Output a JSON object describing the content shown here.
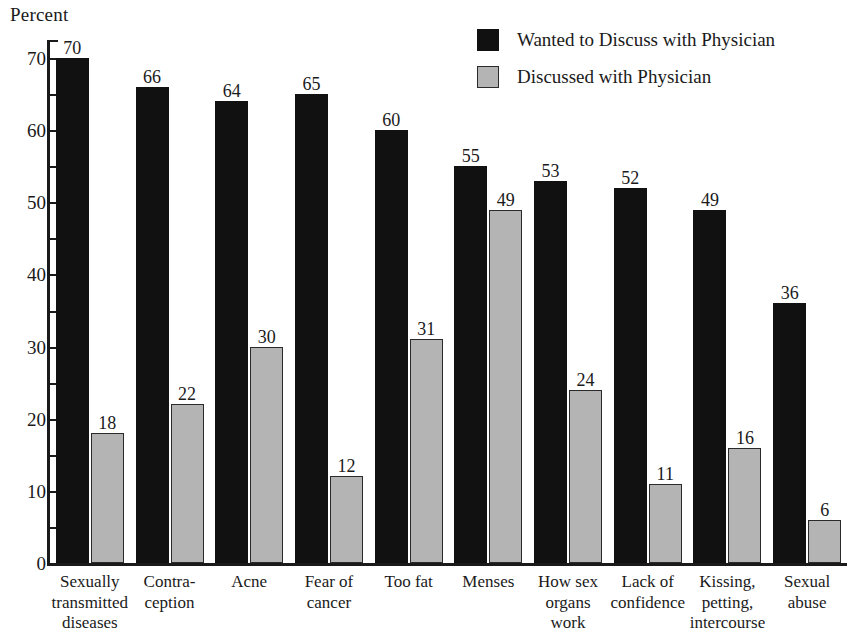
{
  "chart_data": {
    "type": "bar",
    "title": "",
    "subtitle": "",
    "xlabel": "",
    "ylabel": "Percent",
    "ylim": [
      0,
      72.5
    ],
    "yticks": [
      0,
      10,
      20,
      30,
      40,
      50,
      60,
      70
    ],
    "ytick_labels": [
      "0",
      "10",
      "20",
      "30",
      "40",
      "50",
      "60",
      "70"
    ],
    "minor_tick_step": 5,
    "grid": false,
    "legend_position": "top-right",
    "categories": [
      "Sexually transmitted diseases",
      "Contraception",
      "Acne",
      "Fear of cancer",
      "Too fat",
      "Menses",
      "How sex organs work",
      "Lack of confidence",
      "Kissing, petting, intercourse",
      "Sexual abuse"
    ],
    "category_lines": [
      [
        "Sexually",
        "transmitted",
        "diseases"
      ],
      [
        "Contra-",
        "ception"
      ],
      [
        "Acne"
      ],
      [
        "Fear of",
        "cancer"
      ],
      [
        "Too fat"
      ],
      [
        "Menses"
      ],
      [
        "How sex",
        "organs",
        "work"
      ],
      [
        "Lack of",
        "confidence"
      ],
      [
        "Kissing,",
        "petting,",
        "intercourse"
      ],
      [
        "Sexual",
        "abuse"
      ]
    ],
    "series": [
      {
        "name": "Wanted to Discuss with Physician",
        "color": "#111111",
        "values": [
          70,
          66,
          64,
          65,
          60,
          55,
          53,
          52,
          49,
          36
        ]
      },
      {
        "name": "Discussed with Physician",
        "color": "#b4b4b4",
        "values": [
          18,
          22,
          30,
          12,
          31,
          49,
          24,
          11,
          16,
          6
        ]
      }
    ]
  },
  "legend": {
    "items": [
      {
        "label": "Wanted to Discuss with Physician",
        "swatch": "black"
      },
      {
        "label": "Discussed with Physician",
        "swatch": "gray"
      }
    ]
  },
  "axis": {
    "y_title": "Percent"
  }
}
